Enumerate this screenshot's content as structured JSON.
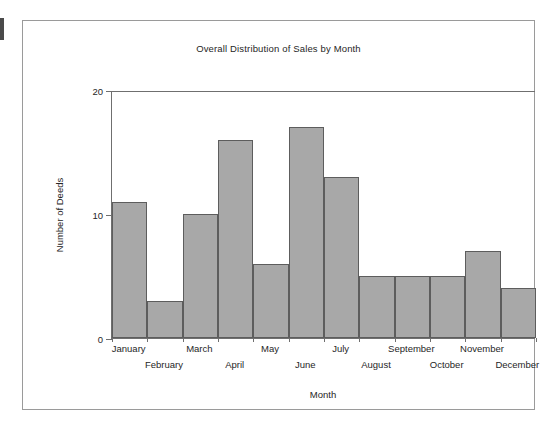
{
  "chart_data": {
    "type": "bar",
    "title": "Overall Distribution of Sales by Month",
    "xlabel": "Month",
    "ylabel": "Number of Deeds",
    "categories": [
      "January",
      "February",
      "March",
      "April",
      "May",
      "June",
      "July",
      "August",
      "September",
      "October",
      "November",
      "December"
    ],
    "values": [
      11,
      3,
      10,
      16,
      6,
      17,
      13,
      5,
      5,
      5,
      7,
      4
    ],
    "ylim": [
      0,
      20
    ],
    "ytick_labels": [
      "0",
      "10",
      "20"
    ],
    "ytick_values": [
      0,
      10,
      20
    ],
    "grid": false,
    "legend": null,
    "bar_fill_color": "#a8a8a8",
    "bar_edge_color": "#5d5d5d",
    "axis_color": "#6f6f6f",
    "text_color": "#262626",
    "background_color": "#ffffff",
    "frame_color": "#9a9a9a",
    "label_stagger_rows": [
      0,
      1,
      0,
      1,
      0,
      1,
      0,
      1,
      0,
      1,
      0,
      1
    ]
  }
}
